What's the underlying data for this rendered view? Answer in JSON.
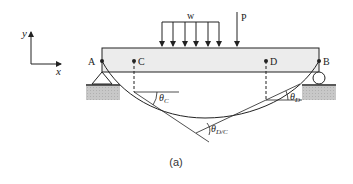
{
  "figure": {
    "caption": "(a)",
    "axes": {
      "x_label": "x",
      "y_label": "y"
    },
    "loads": {
      "distributed_label": "w",
      "point_label": "P"
    },
    "points": {
      "A": "A",
      "B": "B",
      "C": "C",
      "D": "D"
    },
    "angles": {
      "theta_c": {
        "main": "θ",
        "sub": "C"
      },
      "theta_d": {
        "main": "θ",
        "sub": "D"
      },
      "theta_dc": {
        "main": "θ",
        "sub": "D/C"
      }
    },
    "colors": {
      "beam_fill": "#ececec",
      "ground_fill": "#c8c8c8",
      "line": "#222222"
    }
  }
}
